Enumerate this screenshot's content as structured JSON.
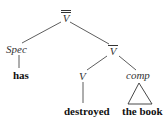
{
  "diagram": {
    "type": "syntax-tree",
    "nodes": {
      "root": {
        "label": "V",
        "bars": 2
      },
      "spec": {
        "label": "Spec"
      },
      "vbar": {
        "label": "V",
        "bars": 1
      },
      "v": {
        "label": "V"
      },
      "comp": {
        "label": "comp"
      }
    },
    "leaves": {
      "has": "has",
      "destroyed": "destroyed",
      "the_book": "the book"
    },
    "edges": [
      [
        "root",
        "spec"
      ],
      [
        "root",
        "vbar"
      ],
      [
        "spec",
        "has"
      ],
      [
        "vbar",
        "v"
      ],
      [
        "vbar",
        "comp"
      ],
      [
        "v",
        "destroyed"
      ],
      [
        "comp",
        "the_book (triangle)"
      ]
    ],
    "colors": {
      "line": "#333333",
      "text": "#111111"
    }
  }
}
